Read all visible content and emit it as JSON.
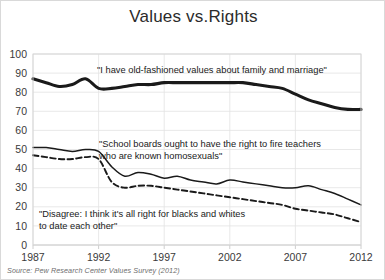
{
  "chart_data": {
    "type": "line",
    "title": "Values vs.Rights",
    "xlabel": "",
    "ylabel": "",
    "xlim": [
      1987,
      2012
    ],
    "ylim": [
      0,
      100
    ],
    "grid": true,
    "legend_position": "none",
    "source": "Source: Pew Research Center Values Survey (2012)",
    "xticks": [
      "1987",
      "1992",
      "1997",
      "2002",
      "2007",
      "2012"
    ],
    "xtick_values": [
      1987,
      1992,
      1997,
      2002,
      2007,
      2012
    ],
    "yticks": [
      "0",
      "10",
      "20",
      "30",
      "40",
      "50",
      "60",
      "70",
      "80",
      "90",
      "100"
    ],
    "ytick_values": [
      0,
      10,
      20,
      30,
      40,
      50,
      60,
      70,
      80,
      90,
      100
    ],
    "x": [
      1987,
      1988,
      1989,
      1990,
      1991,
      1992,
      1993,
      1994,
      1995,
      1996,
      1997,
      1998,
      1999,
      2000,
      2001,
      2002,
      2003,
      2004,
      2005,
      2006,
      2007,
      2008,
      2009,
      2010,
      2011,
      2012
    ],
    "series": [
      {
        "name": "I have old-fashioned values about family and marriage",
        "style": "solid-thick",
        "color": "#1a1a1a",
        "values": [
          87,
          85,
          83,
          84,
          87,
          82,
          82,
          83,
          84,
          84,
          85,
          85,
          85,
          85,
          85,
          85,
          85,
          84,
          83,
          82,
          79,
          76,
          74,
          72,
          71,
          71
        ]
      },
      {
        "name": "School boards ought to have the right to fire teachers who are known homosexuals",
        "style": "solid-thin",
        "color": "#1a1a1a",
        "values": [
          51,
          51,
          50,
          49,
          50,
          49,
          41,
          36,
          38,
          37,
          35,
          36,
          34,
          33,
          32,
          34,
          33,
          32,
          31,
          30,
          30,
          31,
          29,
          27,
          24,
          21
        ]
      },
      {
        "name": "Disagree: I think it's all right for blacks and whites to date each other",
        "style": "dashed",
        "color": "#1a1a1a",
        "values": [
          47,
          46,
          45,
          45,
          46,
          45,
          33,
          30,
          31,
          31,
          30,
          29,
          28,
          27,
          26,
          25,
          24,
          23,
          22,
          21,
          19,
          18,
          17,
          16,
          14,
          12
        ]
      }
    ],
    "annotations": [
      {
        "name": "annotation-values",
        "lines": [
          "\"I have old-fashioned values about family and marriage\""
        ],
        "x": 96,
        "y": 72
      },
      {
        "name": "annotation-school-boards",
        "lines": [
          "\"School boards ought to have the right to fire teachers",
          "who are known homosexuals\""
        ],
        "x": 98,
        "y": 146
      },
      {
        "name": "annotation-disagree",
        "lines": [
          "\"Disagree: I think it's all right for blacks and whites",
          "to date each other\""
        ],
        "x": 38,
        "y": 216
      }
    ]
  }
}
